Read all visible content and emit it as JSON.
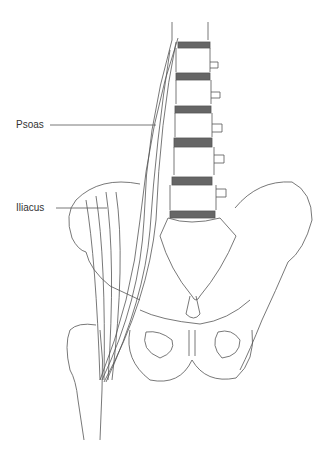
{
  "diagram": {
    "labels": [
      {
        "id": "psoas",
        "text": "Psoas"
      },
      {
        "id": "iliacus",
        "text": "Iliacus"
      }
    ],
    "colors": {
      "line": "#555555",
      "disc": "#666666",
      "background": "#ffffff"
    }
  }
}
